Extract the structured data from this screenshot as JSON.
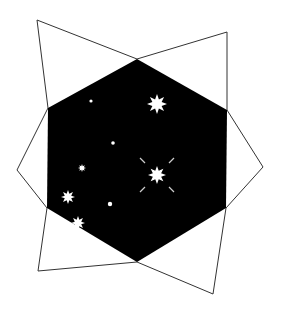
{
  "figure": {
    "description": "Hexagon filled with a black starfield, framed by two overlapping outlined quadrilaterals forming a star-like outline",
    "colors": {
      "background": "#ffffff",
      "hexagon_fill": "#000000",
      "outline": "#333333",
      "star": "#ffffff"
    },
    "hexagon": [
      [
        137,
        59
      ],
      [
        227,
        110
      ],
      [
        226,
        208
      ],
      [
        137,
        262
      ],
      [
        47,
        208
      ],
      [
        48,
        108
      ]
    ],
    "outline_shape_a": [
      [
        37,
        20
      ],
      [
        137,
        59
      ],
      [
        227,
        32
      ],
      [
        227,
        110
      ],
      [
        263,
        167
      ],
      [
        226,
        208
      ],
      [
        213,
        294
      ],
      [
        137,
        262
      ],
      [
        38,
        271
      ],
      [
        47,
        208
      ],
      [
        17,
        170
      ],
      [
        48,
        108
      ]
    ],
    "stars": [
      {
        "cx": 157,
        "cy": 104,
        "r": 10,
        "points": 8
      },
      {
        "cx": 157,
        "cy": 175,
        "r": 9,
        "points": 8,
        "rays": true
      },
      {
        "cx": 68,
        "cy": 197,
        "r": 7,
        "points": 8
      },
      {
        "cx": 78,
        "cy": 223,
        "r": 7,
        "points": 8
      },
      {
        "cx": 82,
        "cy": 168,
        "r": 4,
        "points": 8
      },
      {
        "cx": 91,
        "cy": 101,
        "r": 1.6,
        "points": 0
      },
      {
        "cx": 113,
        "cy": 143,
        "r": 1.8,
        "points": 0
      },
      {
        "cx": 110,
        "cy": 204,
        "r": 2.2,
        "points": 0
      }
    ]
  }
}
